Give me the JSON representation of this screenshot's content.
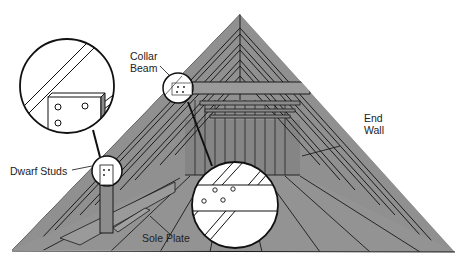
{
  "diagram": {
    "labels": {
      "collar_beam_line1": "Collar",
      "collar_beam_line2": "Beam",
      "end_wall_line1": "End",
      "end_wall_line2": "Wall",
      "dwarf_studs": "Dwarf Studs",
      "sole_plate": "Sole Plate"
    },
    "callouts": [
      {
        "name": "collar-beam-detail",
        "shape": "circle"
      },
      {
        "name": "dwarf-stud-detail",
        "shape": "circle"
      },
      {
        "name": "collar-beam-magnified",
        "shape": "circle"
      },
      {
        "name": "dwarf-stud-magnified",
        "shape": "circle"
      }
    ],
    "colors": {
      "roof_gray": "#8f8f8f",
      "dark_gray": "#7a7a7a",
      "line": "#1a1a1a",
      "background": "#ffffff"
    }
  }
}
